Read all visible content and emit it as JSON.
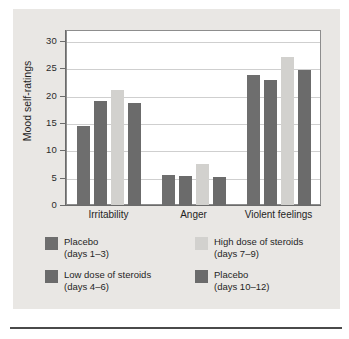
{
  "chart_data": {
    "type": "bar",
    "title": "",
    "xlabel": "",
    "ylabel": "Mood self-ratings",
    "ylim": [
      0,
      32
    ],
    "yticks": [
      0,
      5,
      10,
      15,
      20,
      25,
      30
    ],
    "ytick_labels": [
      "0",
      "5",
      "10",
      "15",
      "20",
      "25",
      "30"
    ],
    "grid": "horizontal",
    "legend_position": "below",
    "categories": [
      "Irritability",
      "Anger",
      "Violent feelings"
    ],
    "series": [
      {
        "name": "Placebo (days 1–3)",
        "label_line1": "Placebo",
        "label_line2": "(days 1–3)",
        "color": "#6e6e6e",
        "values": [
          14.5,
          5.4,
          23.8
        ]
      },
      {
        "name": "Low dose of steroids (days 4–6)",
        "label_line1": "Low dose of steroids",
        "label_line2": "(days 4–6)",
        "color": "#6b6b6b",
        "values": [
          19.0,
          5.3,
          22.8
        ]
      },
      {
        "name": "High dose of steroids (days 7–9)",
        "label_line1": "High dose of steroids",
        "label_line2": "(days 7–9)",
        "color": "#d2d1ce",
        "values": [
          21.0,
          7.5,
          27.0
        ]
      },
      {
        "name": "Placebo (days 10–12)",
        "label_line1": "Placebo",
        "label_line2": "(days 10–12)",
        "color": "#6b6b6b",
        "values": [
          18.7,
          5.2,
          24.6
        ]
      }
    ]
  },
  "colors": {
    "page_background": "#ffffff",
    "panel_background": "#e9e7e4",
    "plot_background": "#ffffff",
    "plot_border": "#8d8d8d",
    "gridline": "#cfcfcf",
    "axis": "#6b6b6b",
    "text": "#1f1f1f",
    "rule": "#4a4a4a"
  }
}
